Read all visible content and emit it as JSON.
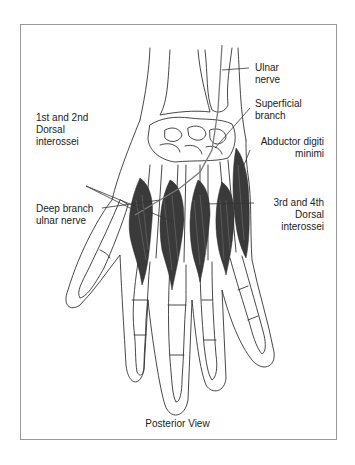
{
  "figure": {
    "caption": "Posterior View",
    "labels": {
      "ulnar_nerve": [
        "Ulnar",
        "nerve"
      ],
      "superficial_branch": [
        "Superficial",
        "branch"
      ],
      "abductor_digiti_minimi": [
        "Abductor digiti",
        "minimi"
      ],
      "dorsal_interossei_1_2": [
        "1st and 2nd",
        "Dorsal",
        "interossei"
      ],
      "deep_branch_ulnar_nerve": [
        "Deep branch",
        "ulnar nerve"
      ],
      "dorsal_interossei_3_4": [
        "3rd and 4th",
        "Dorsal",
        "interossei"
      ]
    },
    "colors": {
      "line": "#333333",
      "muscle": "#3a3a3a",
      "nerve": "#7a7a7a",
      "frame": "#9a9a9a"
    }
  }
}
